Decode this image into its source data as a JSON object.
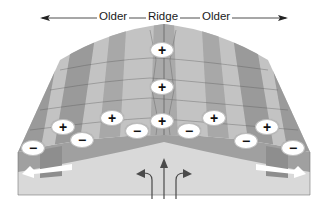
{
  "diagram": {
    "title_labels": {
      "left": "Older",
      "center": "Ridge",
      "right": "Older"
    },
    "symbols": {
      "normal": "+",
      "reversed": "−"
    },
    "polarity_markers": [
      {
        "id": "m1",
        "sign": "+",
        "x": 162,
        "y": 50
      },
      {
        "id": "m2",
        "sign": "+",
        "x": 162,
        "y": 87
      },
      {
        "id": "m3",
        "sign": "+",
        "x": 162,
        "y": 121
      },
      {
        "id": "m4",
        "sign": "+",
        "x": 112,
        "y": 118
      },
      {
        "id": "m5",
        "sign": "+",
        "x": 214,
        "y": 118
      },
      {
        "id": "m6",
        "sign": "+",
        "x": 63,
        "y": 127
      },
      {
        "id": "m7",
        "sign": "+",
        "x": 267,
        "y": 127
      },
      {
        "id": "m8",
        "sign": "−",
        "x": 137,
        "y": 131
      },
      {
        "id": "m9",
        "sign": "−",
        "x": 189,
        "y": 131
      },
      {
        "id": "m10",
        "sign": "−",
        "x": 82,
        "y": 140
      },
      {
        "id": "m11",
        "sign": "−",
        "x": 246,
        "y": 141
      },
      {
        "id": "m12",
        "sign": "−",
        "x": 33,
        "y": 148
      },
      {
        "id": "m13",
        "sign": "−",
        "x": 293,
        "y": 148
      }
    ],
    "colors": {
      "stripe_dark": "#9a9a9a",
      "stripe_light": "#c4c4c4",
      "mantle": "#d9d9d9",
      "arrow": "#ffffff",
      "flow_arrow": "#4a4a4a"
    }
  }
}
